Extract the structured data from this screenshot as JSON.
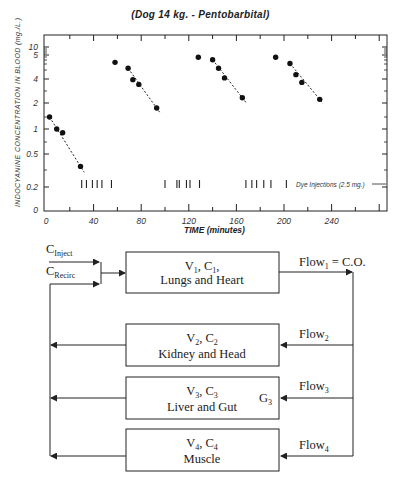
{
  "chart_data": {
    "type": "scatter",
    "title": "(Dog 14 kg. - Pentobarbital)",
    "xlabel": "TIME (minutes)",
    "ylabel": "INDOCYANINE CONCENTRATION IN BLOOD (mg./L.)",
    "x_ticks": [
      "0",
      "40",
      "80",
      "120",
      "160",
      "200",
      "240"
    ],
    "y_ticks": [
      "10",
      "5",
      "4",
      "2",
      "1",
      "0.5",
      "0.2",
      "0"
    ],
    "xlim": [
      0,
      290
    ],
    "yscale": "log",
    "grid": false,
    "series": [
      {
        "name": "Decay 1",
        "x": [
          3,
          9,
          14,
          29
        ],
        "y": [
          1.4,
          1.0,
          0.9,
          0.35
        ],
        "fit_line": "dashed"
      },
      {
        "name": "Decay 2",
        "x": [
          58,
          69,
          73,
          78,
          93
        ],
        "y": [
          6.5,
          5.5,
          4.0,
          3.5,
          1.8
        ],
        "fit_line": "dashed"
      },
      {
        "name": "Decay 3",
        "x": [
          128,
          140,
          145,
          150,
          165
        ],
        "y": [
          7.5,
          7.0,
          5.5,
          4.2,
          2.4
        ],
        "fit_line": "dashed"
      },
      {
        "name": "Decay 4",
        "x": [
          193,
          205,
          210,
          215,
          230
        ],
        "y": [
          7.5,
          6.3,
          4.6,
          3.7,
          2.3
        ],
        "fit_line": "dashed"
      }
    ],
    "dye_injections": {
      "label": "Dye Injections (2.5 mg.)",
      "times": [
        30,
        34,
        39,
        43,
        47,
        55,
        100,
        110,
        112,
        118,
        121,
        129,
        168,
        173,
        177,
        183,
        189,
        202
      ]
    }
  },
  "diagram": {
    "inputs": {
      "inject": {
        "main": "C",
        "sub": "Inject"
      },
      "recirc": {
        "main": "C",
        "sub": "Recirc"
      }
    },
    "compartments": [
      {
        "line1_parts": [
          "V",
          "1",
          ", C",
          "1",
          ","
        ],
        "line2": "Lungs and Heart"
      },
      {
        "line1_parts": [
          "V",
          "2",
          ", C",
          "2",
          ""
        ],
        "line2": "Kidney and Head"
      },
      {
        "line1_parts": [
          "V",
          "3",
          ", C",
          "3",
          ""
        ],
        "line2": "Liver and Gut"
      },
      {
        "line1_parts": [
          "V",
          "4",
          ", C",
          "4",
          ""
        ],
        "line2": "Muscle"
      }
    ],
    "flows": [
      {
        "main": "Flow",
        "sub": "1",
        "suffix": " = C.O."
      },
      {
        "main": "Flow",
        "sub": "2",
        "suffix": ""
      },
      {
        "main": "Flow",
        "sub": "3",
        "suffix": ""
      },
      {
        "main": "Flow",
        "sub": "4",
        "suffix": ""
      }
    ],
    "clearance": {
      "main": "G",
      "sub": "3"
    }
  }
}
